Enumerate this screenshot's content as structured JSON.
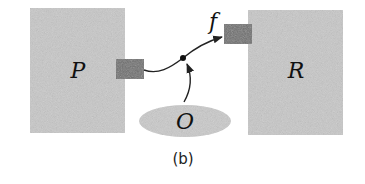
{
  "diagram": {
    "nodes": {
      "P": {
        "label": "P"
      },
      "R": {
        "label": "R"
      },
      "O": {
        "label": "O"
      }
    },
    "edge_label": "f",
    "caption": "(b)"
  },
  "colors": {
    "block_fill": "#c8c8c8",
    "port_fill": "#6e6e6e",
    "line": "#222222"
  }
}
